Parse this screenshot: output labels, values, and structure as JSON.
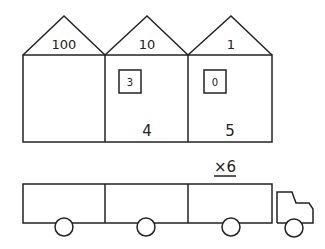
{
  "houses": [
    {
      "place_value": "100",
      "box_value": "",
      "bottom_value": ""
    },
    {
      "place_value": "10",
      "box_value": "3",
      "bottom_value": "4"
    },
    {
      "place_value": "1",
      "box_value": "0",
      "bottom_value": "5"
    }
  ],
  "truck": {
    "multiplier": "×6",
    "trailer_sections": 3
  }
}
